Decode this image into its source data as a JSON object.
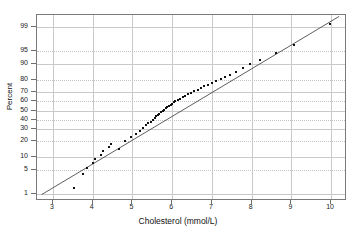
{
  "chart_data": {
    "type": "scatter",
    "title": "",
    "subtitle": "",
    "xlabel": "Cholesterol (mmol/L)",
    "ylabel": "Percent",
    "xlim": [
      2.6,
      10.4
    ],
    "ylim_percent": [
      0.6,
      99.6
    ],
    "grid": true,
    "legend": "none",
    "annotations": [],
    "reference_line": {
      "label": "normal fit line",
      "x_start": 2.72,
      "y_start_percent": 0.85,
      "x_end": 10.25,
      "y_end_percent": 99.55
    },
    "xticks": [
      3,
      4,
      5,
      6,
      7,
      8,
      9,
      10
    ],
    "xtick_labels": [
      "3",
      "4",
      "5",
      "6",
      "7",
      "8",
      "9",
      "10"
    ],
    "yticks_percent": [
      1,
      5,
      10,
      20,
      30,
      40,
      50,
      60,
      70,
      80,
      90,
      95,
      99
    ],
    "ytick_labels": [
      "1",
      "5",
      "10",
      "20",
      "30",
      "40",
      "50",
      "60",
      "70",
      "80",
      "90",
      "95",
      "99"
    ],
    "series": [
      {
        "name": "Cholesterol sample quantiles",
        "marker": "square",
        "color": "#111111",
        "n": 56,
        "x": [
          3.52,
          3.75,
          3.86,
          4.02,
          4.06,
          4.22,
          4.26,
          4.42,
          4.46,
          4.66,
          4.82,
          4.96,
          5.08,
          5.18,
          5.26,
          5.34,
          5.4,
          5.46,
          5.52,
          5.56,
          5.6,
          5.64,
          5.68,
          5.72,
          5.76,
          5.8,
          5.84,
          5.88,
          5.92,
          5.96,
          6.0,
          6.04,
          6.08,
          6.14,
          6.2,
          6.26,
          6.32,
          6.4,
          6.48,
          6.56,
          6.64,
          6.72,
          6.8,
          6.9,
          7.0,
          7.1,
          7.22,
          7.34,
          7.46,
          7.6,
          7.78,
          7.96,
          8.2,
          8.62,
          9.06,
          9.98
        ],
        "y_percent": [
          1.6,
          4.0,
          5.6,
          7.2,
          9.0,
          11.0,
          13.0,
          15.5,
          18.0,
          14.2,
          20.0,
          23.0,
          26.0,
          29.0,
          31.5,
          34.0,
          36.0,
          38.0,
          40.0,
          42.0,
          43.5,
          45.0,
          46.5,
          48.0,
          49.5,
          51.0,
          52.5,
          54.0,
          55.0,
          56.5,
          57.5,
          59.0,
          60.0,
          61.5,
          63.0,
          64.5,
          66.0,
          67.5,
          69.0,
          70.5,
          72.0,
          73.5,
          75.0,
          76.5,
          78.0,
          79.5,
          81.0,
          82.5,
          84.0,
          86.0,
          88.0,
          90.0,
          92.0,
          94.5,
          96.5,
          99.2
        ]
      }
    ]
  },
  "axes": {
    "y_title": "Percent",
    "x_title": "Cholesterol (mmol/L)"
  },
  "colors": {
    "line": "#4a4a4a",
    "point": "#111111",
    "grid": "#c9c9c9",
    "frame": "#7a7a7a",
    "background": "#ffffff"
  }
}
